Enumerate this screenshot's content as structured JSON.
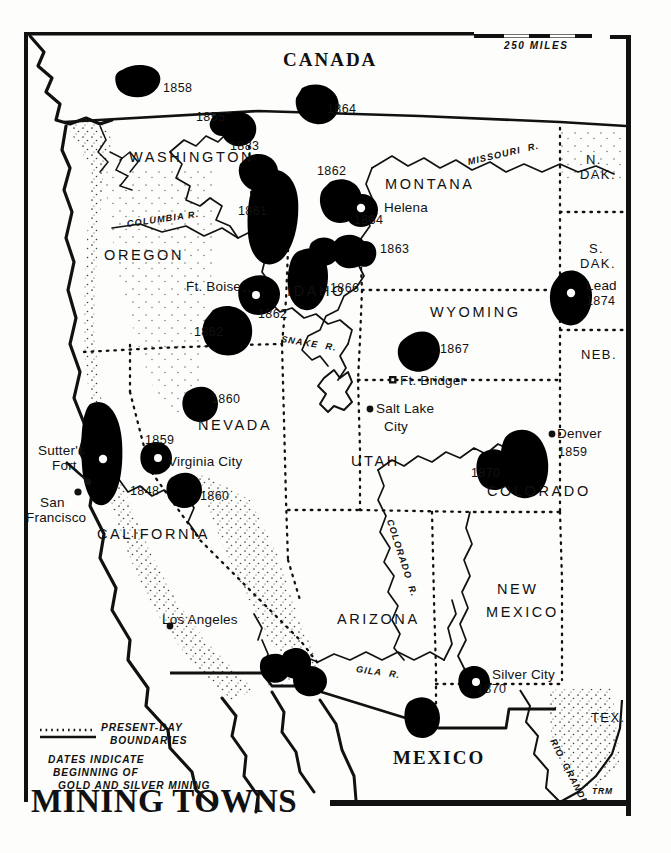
{
  "map": {
    "title": "MINING TOWNS",
    "signature": "TRM",
    "scale": {
      "label": "250 MILES"
    },
    "legend": {
      "boundary_label_line1": "PRESENT-DAY",
      "boundary_label_line2": "BOUNDARIES",
      "note_line1": "DATES INDICATE",
      "note_line2": "BEGINNING OF",
      "note_line3": "GOLD AND SILVER MINING"
    },
    "colors": {
      "ink": "#111111",
      "paper": "#fdfdfb",
      "ore_fill": "#000000",
      "stipple": "#333333"
    },
    "countries": [
      {
        "name": "CANADA",
        "x": 283,
        "y": 58
      },
      {
        "name": "MEXICO",
        "x": 393,
        "y": 755
      }
    ],
    "states": [
      {
        "name": "WASHINGTON",
        "x": 129,
        "y": 158,
        "size": "state"
      },
      {
        "name": "OREGON",
        "x": 104,
        "y": 256,
        "size": "state"
      },
      {
        "name": "IDAHO",
        "x": 287,
        "y": 292,
        "size": "state"
      },
      {
        "name": "MONTANA",
        "x": 385,
        "y": 185,
        "size": "state"
      },
      {
        "name": "WYOMING",
        "x": 430,
        "y": 313,
        "size": "state"
      },
      {
        "name": "NEVADA",
        "x": 198,
        "y": 426,
        "size": "state"
      },
      {
        "name": "UTAH",
        "x": 351,
        "y": 462,
        "size": "state"
      },
      {
        "name": "COLORADO",
        "x": 487,
        "y": 492,
        "size": "state"
      },
      {
        "name": "CALIFORNIA",
        "x": 97,
        "y": 535,
        "size": "state"
      },
      {
        "name": "ARIZONA",
        "x": 337,
        "y": 620,
        "size": "state"
      },
      {
        "name": "NEW",
        "x": 497,
        "y": 590,
        "size": "state"
      },
      {
        "name": "MEXICO",
        "x": 486,
        "y": 613,
        "size": "state"
      },
      {
        "name": "N.",
        "x": 586,
        "y": 160,
        "size": "state-sm"
      },
      {
        "name": "DAK.",
        "x": 580,
        "y": 175,
        "size": "state-sm"
      },
      {
        "name": "S.",
        "x": 589,
        "y": 249,
        "size": "state-sm"
      },
      {
        "name": "DAK.",
        "x": 580,
        "y": 264,
        "size": "state-sm"
      },
      {
        "name": "NEB.",
        "x": 581,
        "y": 355,
        "size": "state-sm"
      },
      {
        "name": "TEX.",
        "x": 591,
        "y": 718,
        "size": "state-sm"
      }
    ],
    "cities": [
      {
        "name": "Helena",
        "x": 384,
        "y": 208,
        "dot": false
      },
      {
        "name": "Ft. Boise",
        "x": 186,
        "y": 287,
        "dot": false
      },
      {
        "name": "Lead",
        "x": 586,
        "y": 286,
        "dot": false
      },
      {
        "name": "Ft. Bridger",
        "x": 400,
        "y": 381,
        "dot": false
      },
      {
        "name": "Salt Lake",
        "x": 373,
        "y": 413,
        "dot": true
      },
      {
        "name": "City",
        "x": 380,
        "y": 430,
        "dot": false
      },
      {
        "name": "Denver",
        "x": 557,
        "y": 437,
        "dot": true
      },
      {
        "name": "Virginia City",
        "x": 168,
        "y": 462,
        "dot": false
      },
      {
        "name": "Sutter's",
        "x": 40,
        "y": 452,
        "dot": false
      },
      {
        "name": "Fort",
        "x": 53,
        "y": 466,
        "dot": false
      },
      {
        "name": "San",
        "x": 41,
        "y": 503,
        "dot": false
      },
      {
        "name": "Francisco",
        "x": 27,
        "y": 518,
        "dot": false
      },
      {
        "name": "Los Angeles",
        "x": 162,
        "y": 620,
        "dot": true
      },
      {
        "name": "Silver City",
        "x": 492,
        "y": 675,
        "dot": false
      }
    ],
    "rivers": [
      {
        "name": "COLUMBIA R.",
        "x": 127,
        "y": 225,
        "rot": -8
      },
      {
        "name": "MISSOURI  R.",
        "x": 468,
        "y": 163,
        "rot": -13
      },
      {
        "name": "SNAKE  R.",
        "x": 281,
        "y": 340,
        "rot": 9
      },
      {
        "name": "COLORADO  R.",
        "x": 389,
        "y": 520,
        "rot": 72
      },
      {
        "name": "GILA  R.",
        "x": 356,
        "y": 670,
        "rot": 8
      },
      {
        "name": "RIO  GRANDE",
        "x": 552,
        "y": 740,
        "rot": 63
      }
    ],
    "ore_dates": [
      {
        "year": "1858",
        "x": 163,
        "y": 89
      },
      {
        "year": "1855",
        "x": 198,
        "y": 118
      },
      {
        "year": "1864",
        "x": 327,
        "y": 110
      },
      {
        "year": "1883",
        "x": 232,
        "y": 147
      },
      {
        "year": "1862",
        "x": 317,
        "y": 172
      },
      {
        "year": "1861",
        "x": 240,
        "y": 212
      },
      {
        "year": "1864",
        "x": 356,
        "y": 221
      },
      {
        "year": "1863",
        "x": 380,
        "y": 250
      },
      {
        "year": "1866",
        "x": 330,
        "y": 289
      },
      {
        "year": "1862",
        "x": 260,
        "y": 315
      },
      {
        "year": "1862",
        "x": 196,
        "y": 333
      },
      {
        "year": "1874",
        "x": 586,
        "y": 302
      },
      {
        "year": "1867",
        "x": 440,
        "y": 350
      },
      {
        "year": "1860",
        "x": 211,
        "y": 400
      },
      {
        "year": "1859",
        "x": 147,
        "y": 441
      },
      {
        "year": "1859",
        "x": 558,
        "y": 453
      },
      {
        "year": "1870",
        "x": 473,
        "y": 474
      },
      {
        "year": "1848",
        "x": 132,
        "y": 492
      },
      {
        "year": "1860",
        "x": 200,
        "y": 497
      },
      {
        "year": "1870",
        "x": 479,
        "y": 690
      }
    ]
  }
}
